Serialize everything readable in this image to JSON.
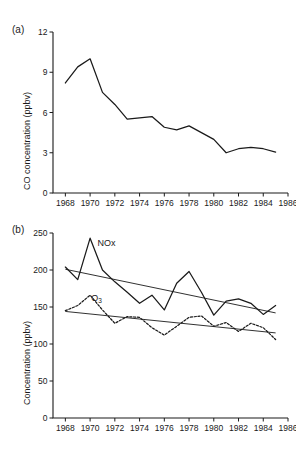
{
  "figure": {
    "panel_a_label": "(a)",
    "panel_b_label": "(b)"
  },
  "chart_data": [
    {
      "type": "line",
      "panel": "(a)",
      "title": "",
      "xlabel": "",
      "ylabel": "CO concentration (ppbv)",
      "xlim": [
        1967,
        1986
      ],
      "ylim": [
        0,
        12
      ],
      "xticks": [
        1968,
        1970,
        1972,
        1974,
        1976,
        1978,
        1980,
        1982,
        1984,
        1986
      ],
      "yticks": [
        0,
        3,
        6,
        9,
        12
      ],
      "xtick_labels": [
        "1968",
        "1970",
        "1972",
        "1974",
        "1976",
        "1978",
        "1980",
        "1982",
        "1984",
        "1986"
      ],
      "ytick_labels": [
        "0",
        "3",
        "6",
        "9",
        "12"
      ],
      "grid": false,
      "legend": "none",
      "series": [
        {
          "name": "CO",
          "style": "solid",
          "x": [
            1968,
            1969,
            1970,
            1971,
            1972,
            1973,
            1974,
            1975,
            1976,
            1977,
            1978,
            1979,
            1980,
            1981,
            1982,
            1983,
            1984,
            1985
          ],
          "values": [
            8.2,
            9.4,
            10.0,
            7.5,
            6.6,
            5.5,
            5.6,
            5.7,
            4.9,
            4.7,
            5.0,
            4.5,
            4.0,
            3.0,
            3.3,
            3.4,
            3.3,
            3.05
          ]
        }
      ]
    },
    {
      "type": "line",
      "panel": "(b)",
      "title": "",
      "xlabel": "",
      "ylabel": "Concentration (ppbv)",
      "xlim": [
        1967,
        1986
      ],
      "ylim": [
        0,
        250
      ],
      "xticks": [
        1968,
        1970,
        1972,
        1974,
        1976,
        1978,
        1980,
        1982,
        1984,
        1986
      ],
      "yticks": [
        0,
        50,
        100,
        150,
        200,
        250
      ],
      "xtick_labels": [
        "1968",
        "1970",
        "1972",
        "1974",
        "1976",
        "1978",
        "1980",
        "1982",
        "1984",
        "1986"
      ],
      "ytick_labels": [
        "0",
        "50",
        "100",
        "150",
        "200",
        "250"
      ],
      "grid": false,
      "legend": "inline-annotations",
      "annotations": [
        {
          "text": "NOx",
          "x": 1970.6,
          "y": 232
        },
        {
          "text": "O3",
          "x": 1970.1,
          "y": 158
        }
      ],
      "series": [
        {
          "name": "NOx",
          "style": "solid",
          "x": [
            1968,
            1969,
            1970,
            1971,
            1972,
            1973,
            1974,
            1975,
            1976,
            1977,
            1978,
            1979,
            1980,
            1981,
            1982,
            1983,
            1984,
            1985
          ],
          "values": [
            204,
            187,
            243,
            200,
            184,
            170,
            155,
            166,
            146,
            182,
            198,
            170,
            139,
            158,
            161,
            155,
            140,
            152
          ]
        },
        {
          "name": "NOx trend",
          "style": "trend",
          "x": [
            1968,
            1985
          ],
          "values": [
            201,
            142
          ]
        },
        {
          "name": "O3",
          "style": "dotted",
          "x": [
            1968,
            1969,
            1970,
            1971,
            1972,
            1973,
            1974,
            1975,
            1976,
            1977,
            1978,
            1979,
            1980,
            1981,
            1982,
            1983,
            1984,
            1985
          ],
          "values": [
            145,
            152,
            166,
            146,
            128,
            137,
            136,
            122,
            112,
            124,
            136,
            138,
            124,
            129,
            117,
            128,
            122,
            106
          ]
        },
        {
          "name": "O3 trend",
          "style": "trend",
          "x": [
            1968,
            1985
          ],
          "values": [
            144,
            115
          ]
        }
      ]
    }
  ]
}
